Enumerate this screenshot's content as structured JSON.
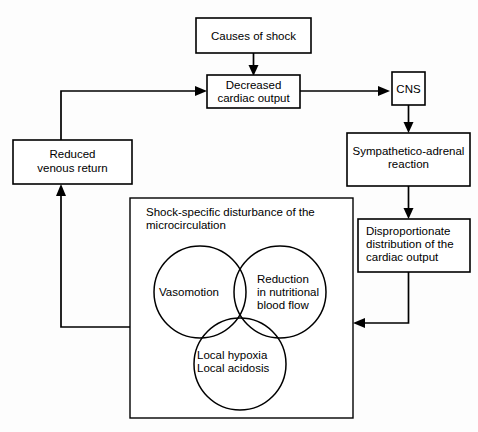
{
  "diagram": {
    "background_color": "#fdfdfd",
    "line_color": "#000000",
    "nodes": {
      "causes_of_shock": {
        "label": "Causes of shock",
        "lines": [
          "Causes of shock"
        ]
      },
      "decreased_cardiac_output": {
        "label": "Decreased cardiac output",
        "lines": [
          "Decreased",
          "cardiac output"
        ]
      },
      "cns": {
        "label": "CNS",
        "lines": [
          "CNS"
        ]
      },
      "sympathetico_adrenal_reaction": {
        "label": "Sympathetico-adrenal reaction",
        "lines": [
          "Sympathetico-adrenal",
          "reaction"
        ]
      },
      "disproportionate_distribution": {
        "label": "Disproportionate distribution of the cardiac output",
        "lines": [
          "Disproportionate",
          "distribution of the",
          "cardiac output"
        ]
      },
      "reduced_venous_return": {
        "label": "Reduced venous return",
        "lines": [
          "Reduced",
          "venous return"
        ]
      },
      "microcirculation_panel": {
        "label": "Shock-specific disturbance of the microcirculation",
        "lines": [
          "Shock-specific disturbance of the",
          "microcirculation"
        ]
      }
    },
    "venn": {
      "circle_left": {
        "label": "Vasomotion",
        "lines": [
          "Vasomotion"
        ]
      },
      "circle_right": {
        "label": "Reduction in nutritional blood flow",
        "lines": [
          "Reduction",
          "in nutritional",
          "blood flow"
        ]
      },
      "circle_bottom": {
        "label": "Local hypoxia Local acidosis",
        "lines": [
          "Local hypoxia",
          "Local acidosis"
        ]
      }
    },
    "edges": [
      {
        "from": "causes_of_shock",
        "to": "decreased_cardiac_output"
      },
      {
        "from": "decreased_cardiac_output",
        "to": "cns"
      },
      {
        "from": "cns",
        "to": "sympathetico_adrenal_reaction"
      },
      {
        "from": "sympathetico_adrenal_reaction",
        "to": "disproportionate_distribution"
      },
      {
        "from": "disproportionate_distribution",
        "to": "microcirculation_panel"
      },
      {
        "from": "microcirculation_panel",
        "to": "reduced_venous_return"
      },
      {
        "from": "reduced_venous_return",
        "to": "decreased_cardiac_output"
      }
    ]
  }
}
